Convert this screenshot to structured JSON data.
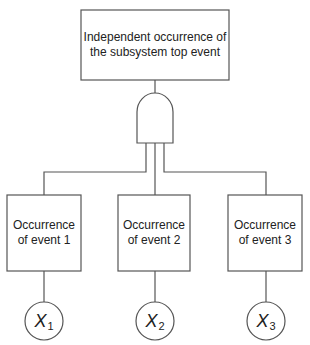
{
  "diagram": {
    "type": "fault-tree",
    "top_event": {
      "label": "Independent occurrence of the subsystem top event"
    },
    "gate": {
      "type": "AND",
      "icon": "and-gate-icon"
    },
    "events": [
      {
        "label": "Occurrence of event 1",
        "variable": "X",
        "subscript": "1"
      },
      {
        "label": "Occurrence of event 2",
        "variable": "X",
        "subscript": "2"
      },
      {
        "label": "Occurrence of event 3",
        "variable": "X",
        "subscript": "3"
      }
    ],
    "colors": {
      "stroke": "#555555",
      "text": "#222222",
      "background": "#ffffff"
    }
  }
}
